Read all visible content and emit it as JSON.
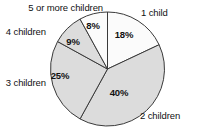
{
  "chart_data": {
    "type": "pie",
    "title": "",
    "subtitle": "",
    "xlabel": "",
    "ylabel": "",
    "legend_position": "outside-labels",
    "grid": false,
    "categories": [
      "1 child",
      "2 children",
      "3 children",
      "4 children",
      "5 or more children"
    ],
    "values": [
      18,
      40,
      25,
      9,
      8
    ],
    "unit": "%",
    "slices": [
      {
        "label": "1 child",
        "value": 18,
        "value_text": "18%",
        "color": "#fbfbfb",
        "start_angle_deg": 0,
        "end_angle_deg": 64.8,
        "pct_label_x": 124,
        "pct_label_y": 38,
        "cat_label_x": 141,
        "cat_label_y": 16,
        "cat_anchor": "start"
      },
      {
        "label": "2 children",
        "value": 40,
        "value_text": "40%",
        "color": "#dcdcdc",
        "start_angle_deg": 64.8,
        "end_angle_deg": 208.8,
        "pct_label_x": 119,
        "pct_label_y": 96,
        "cat_label_x": 140,
        "cat_label_y": 119,
        "cat_anchor": "start"
      },
      {
        "label": "3 children",
        "value": 25,
        "value_text": "25%",
        "color": "#dcdcdc",
        "start_angle_deg": 208.8,
        "end_angle_deg": 298.8,
        "pct_label_x": 60,
        "pct_label_y": 79,
        "cat_label_x": 46,
        "cat_label_y": 86,
        "cat_anchor": "end"
      },
      {
        "label": "4 children",
        "value": 9,
        "value_text": "9%",
        "color": "#dcdcdc",
        "start_angle_deg": 298.8,
        "end_angle_deg": 331.2,
        "pct_label_x": 73,
        "pct_label_y": 45,
        "cat_label_x": 46,
        "cat_label_y": 35,
        "cat_anchor": "end"
      },
      {
        "label": "5 or more children",
        "value": 8,
        "value_text": "8%",
        "color": "#fbfbfb",
        "start_angle_deg": 331.2,
        "end_angle_deg": 360,
        "pct_label_x": 93,
        "pct_label_y": 29,
        "cat_label_x": 103,
        "cat_label_y": 11,
        "cat_anchor": "end"
      }
    ],
    "geometry": {
      "center_x": 107.5,
      "center_y": 69,
      "radius": 57
    },
    "colors": {
      "outline": "#3a3a3a",
      "fill_gray": "#dcdcdc",
      "fill_white": "#fbfbfb",
      "text": "#111111",
      "background": "#ffffff"
    }
  }
}
